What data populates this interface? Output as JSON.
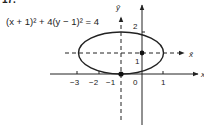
{
  "problem_number": "17.",
  "equation": "(x + 1)² + 4(y − 1)² = 4",
  "axes": {
    "x_label": "x",
    "y_label": "",
    "xbar_label": "x̄",
    "ybar_label": "ȳ"
  },
  "tick_labels": {
    "x_neg3": "−3",
    "x_neg2": "−2",
    "x_neg1": "−1",
    "x_0": "0",
    "x_1": "1",
    "y_1": "1",
    "y_2": "2"
  },
  "colors": {
    "ink": "#222222",
    "background": "#ffffff"
  },
  "ellipse": {
    "center": [
      -1,
      1
    ],
    "semi_major_x": 2,
    "semi_minor_y": 1
  },
  "points": [
    {
      "name": "translated-origin",
      "x": 0,
      "y": 1
    },
    {
      "name": "ellipse-bottom-vertex",
      "x": -1,
      "y": 0
    }
  ]
}
